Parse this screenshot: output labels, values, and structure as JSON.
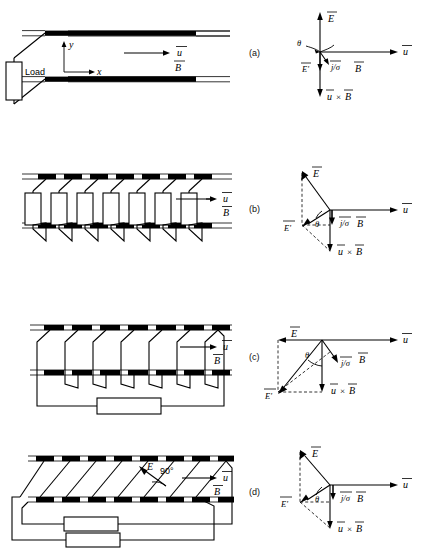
{
  "figure": {
    "panel_labels": {
      "a": "(a)",
      "b": "(b)",
      "c": "(c)",
      "d": "(d)"
    }
  },
  "symbols": {
    "E": "E",
    "E_prime": "E'",
    "u": "u",
    "B": "B",
    "j_over_sigma": "j/σ",
    "theta": "θ",
    "cross": "×",
    "u_cross_B_left": "u",
    "u_cross_B_right": "B",
    "x_axis": "x",
    "y_axis": "y",
    "right_angle": "90°",
    "load": "Load"
  },
  "panels": [
    {
      "id": "a",
      "label": "(a)",
      "name": "continuous-electrode-faraday-generator",
      "channel": {
        "electrode_type": "continuous",
        "segment_count": 1,
        "load_count": 1,
        "load_label": "Load",
        "axes": {
          "x_label": "x",
          "y_label": "y"
        },
        "flow_label": "u",
        "field_label": "B"
      },
      "vector_diagram": {
        "vectors": [
          {
            "name": "E",
            "label": "E",
            "direction": "up"
          },
          {
            "name": "u",
            "label": "u",
            "direction": "right"
          },
          {
            "name": "u_cross_B",
            "label_left": "u",
            "label_op": "×",
            "label_right": "B",
            "direction": "down"
          },
          {
            "name": "E_prime",
            "label": "E'",
            "direction": "down-small"
          },
          {
            "name": "j_over_sigma",
            "label": "j/σ",
            "direction": "down-right-small"
          }
        ],
        "angle_label": "θ",
        "B_label": "B"
      }
    },
    {
      "id": "b",
      "label": "(b)",
      "name": "segmented-electrode-faraday-generator",
      "channel": {
        "electrode_type": "segmented",
        "segment_count": 7,
        "load_count": 7,
        "flow_label": "u",
        "field_label": "B"
      },
      "vector_diagram": {
        "vectors": [
          {
            "name": "E",
            "label": "E",
            "direction": "up-left"
          },
          {
            "name": "u",
            "label": "u",
            "direction": "right"
          },
          {
            "name": "u_cross_B",
            "label_left": "u",
            "label_op": "×",
            "label_right": "B",
            "direction": "down"
          },
          {
            "name": "E_prime",
            "label": "E'",
            "direction": "left"
          },
          {
            "name": "j_over_sigma",
            "label": "j/σ",
            "direction": "down"
          }
        ],
        "angle_label": "θ",
        "B_label": "B"
      }
    },
    {
      "id": "c",
      "label": "(c)",
      "name": "hall-generator",
      "channel": {
        "electrode_type": "segmented-series",
        "segment_count": 7,
        "load_count": 1,
        "flow_label": "u",
        "field_label": "B"
      },
      "vector_diagram": {
        "vectors": [
          {
            "name": "E",
            "label": "E",
            "direction": "left"
          },
          {
            "name": "u",
            "label": "u",
            "direction": "right"
          },
          {
            "name": "u_cross_B",
            "label_left": "u",
            "label_op": "×",
            "label_right": "B",
            "direction": "down"
          },
          {
            "name": "E_prime",
            "label": "E'",
            "direction": "down-left"
          },
          {
            "name": "j_over_sigma",
            "label": "j/σ",
            "direction": "down-right"
          }
        ],
        "angle_label": "θ",
        "B_label": "B"
      }
    },
    {
      "id": "d",
      "label": "(d)",
      "name": "diagonal-conducting-wall-generator",
      "channel": {
        "electrode_type": "diagonal",
        "segment_count": 7,
        "load_count": 2,
        "angle_annotation": "90°",
        "angle_vector_label": "E",
        "flow_label": "u",
        "field_label": "B"
      },
      "vector_diagram": {
        "vectors": [
          {
            "name": "E",
            "label": "E",
            "direction": "up-left"
          },
          {
            "name": "u",
            "label": "u",
            "direction": "right"
          },
          {
            "name": "u_cross_B",
            "label_left": "u",
            "label_op": "×",
            "label_right": "B",
            "direction": "down"
          },
          {
            "name": "E_prime",
            "label": "E'",
            "direction": "left"
          },
          {
            "name": "j_over_sigma",
            "label": "j/σ",
            "direction": "down"
          }
        ],
        "angle_label": "θ",
        "B_label": "B"
      }
    }
  ],
  "colors": {
    "ink": "#000000",
    "background": "#ffffff",
    "electrode_fill": "#000000",
    "resistor_fill": "#ffffff"
  }
}
